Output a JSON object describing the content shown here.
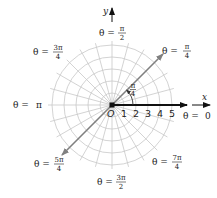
{
  "diagram": {
    "colors": {
      "grid": "#c8c8c8",
      "polar_axis": "#111111",
      "diagonal": "#808080",
      "text": "#222222",
      "background": "#ffffff"
    },
    "origin_label": "O",
    "x_axis_label": "x",
    "y_axis_label": "y",
    "radius_ticks": [
      "1",
      "2",
      "3",
      "4",
      "5"
    ],
    "angle_annotation": {
      "num": "π",
      "den": "4"
    },
    "angle_labels": {
      "zero": {
        "prefix": "θ = ",
        "value": "0"
      },
      "pi_over_4": {
        "prefix": "θ = ",
        "num": "π",
        "den": "4"
      },
      "pi_over_2": {
        "prefix": "θ = ",
        "num": "π",
        "den": "2"
      },
      "three_pi_4": {
        "prefix": "θ = ",
        "num": "3π",
        "den": "4"
      },
      "pi": {
        "prefix": "θ = ",
        "value": "π"
      },
      "five_pi_4": {
        "prefix": "θ = ",
        "num": "5π",
        "den": "4"
      },
      "three_pi_2": {
        "prefix": "θ = ",
        "num": "3π",
        "den": "2"
      },
      "seven_pi_4": {
        "prefix": "θ = ",
        "num": "7π",
        "den": "4"
      }
    },
    "grid": {
      "circles": 5,
      "radial_step_degrees": 15
    }
  }
}
